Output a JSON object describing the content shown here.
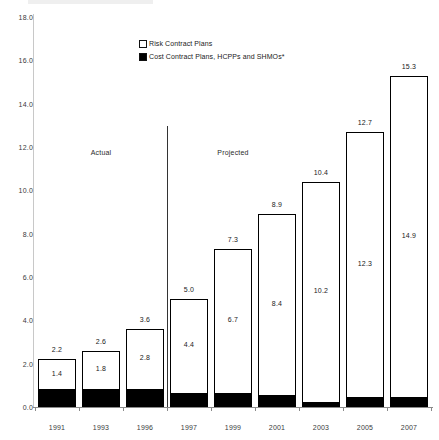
{
  "chart_data": {
    "type": "bar",
    "subtype": "stacked-bar",
    "title": "",
    "xlabel": "",
    "ylabel": "",
    "ylim": [
      0.0,
      18.0
    ],
    "ytick_step": 2.0,
    "yticks": [
      "0.0",
      "2.0",
      "4.0",
      "6.0",
      "8.0",
      "10.0",
      "12.0",
      "14.0",
      "16.0",
      "18.0"
    ],
    "grid": false,
    "legend_position": "top-center",
    "categories": [
      "1991",
      "1993",
      "1996",
      "1997",
      "1999",
      "2001",
      "2003",
      "2005",
      "2007"
    ],
    "series": [
      {
        "name": "Cost Contract Plans, HCPPs and SHMOs*",
        "swatch": "filled",
        "values": [
          0.8,
          0.8,
          0.8,
          0.6,
          0.6,
          0.5,
          0.2,
          0.4,
          0.4
        ]
      },
      {
        "name": "Risk Contract Plans",
        "swatch": "hollow",
        "values": [
          1.4,
          1.8,
          2.8,
          4.4,
          6.7,
          8.4,
          10.2,
          12.3,
          14.9
        ]
      }
    ],
    "totals": [
      2.2,
      2.6,
      3.6,
      5.0,
      7.3,
      8.9,
      10.4,
      12.7,
      15.3
    ],
    "total_labels": [
      "2.2",
      "2.6",
      "3.6",
      "5.0",
      "7.3",
      "8.9",
      "10.4",
      "12.7",
      "15.3"
    ],
    "risk_labels": [
      "1.4",
      "1.8",
      "2.8",
      "4.4",
      "6.7",
      "8.4",
      "10.2",
      "12.3",
      "14.9"
    ],
    "annotations": [
      {
        "text": "Actual",
        "x_category": "1993"
      },
      {
        "text": "Projected",
        "x_category": "1999"
      }
    ],
    "colors": {
      "risk_fill": "#ffffff",
      "cost_fill": "#000000",
      "bar_border": "#000000",
      "axis": "#8a8a8a",
      "text": "#1a1a1a"
    }
  },
  "legend": {
    "items": [
      {
        "label": "Risk Contract Plans",
        "swatch": "hollow"
      },
      {
        "label": "Cost Contract Plans, HCPPs and SHMOs*",
        "swatch": "filled"
      }
    ]
  },
  "phases": {
    "actual": "Actual",
    "projected": "Projected"
  }
}
